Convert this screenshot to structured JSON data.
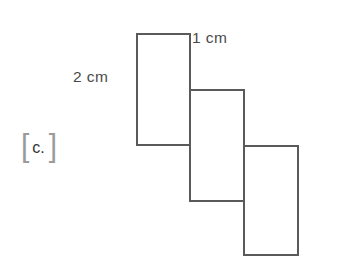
{
  "figure": {
    "background_color": "#ffffff",
    "stroke_color": "#5a5a5a",
    "stroke_width": 2,
    "choice": {
      "open_bracket": "[",
      "letter": "c.",
      "close_bracket": "]",
      "bracket_color": "#9b9b9b",
      "letter_color": "#333333"
    },
    "labels": {
      "width_label": "1 cm",
      "height_label": "2 cm",
      "text_color": "#4a4a4a"
    }
  },
  "chart_data": {
    "type": "diagram",
    "title": "",
    "subtitle": "",
    "xlabel": "",
    "ylabel": "",
    "units": "cm",
    "rectangle_dimensions_cm": {
      "width": 1,
      "height": 2
    },
    "rectangle_count": 3,
    "annotations": [
      "1 cm",
      "2 cm"
    ],
    "shapes": [
      {
        "name": "rectangle-1",
        "x": 137,
        "y": 34,
        "width": 53,
        "height": 111
      },
      {
        "name": "rectangle-2",
        "x": 190,
        "y": 90,
        "width": 54,
        "height": 111
      },
      {
        "name": "rectangle-3",
        "x": 244,
        "y": 146,
        "width": 54,
        "height": 109
      }
    ],
    "grid": false,
    "legend": false
  }
}
